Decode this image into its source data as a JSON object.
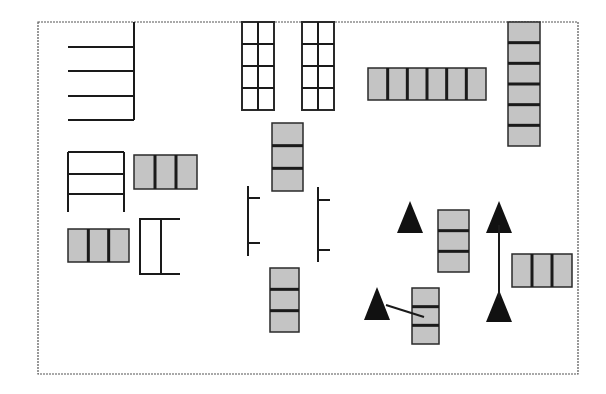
{
  "diagram": {
    "title": "",
    "frame": {
      "x": 38,
      "y": 22,
      "w": 540,
      "h": 352,
      "stroke": "#555555",
      "style": "dashed"
    },
    "colors": {
      "line": "#1a1a1a",
      "seat_fill": "#c4c4c4",
      "seat_stroke": "#2a2a2a",
      "triangle": "#111111"
    },
    "elements": [
      {
        "id": "comb-top-left",
        "type": "comb",
        "spine": {
          "x": 134,
          "y1": 22,
          "y2": 120
        },
        "teeth": [
          47,
          71,
          96,
          120
        ],
        "tooth_x1": 68
      },
      {
        "id": "grid-shelf-1",
        "type": "grid",
        "x": 242,
        "y": 22,
        "w": 32,
        "h": 88,
        "cols": 2,
        "rows": 4
      },
      {
        "id": "grid-shelf-2",
        "type": "grid",
        "x": 302,
        "y": 22,
        "w": 32,
        "h": 88,
        "cols": 2,
        "rows": 4
      },
      {
        "id": "bench-horizontal-6",
        "type": "cells",
        "x": 368,
        "y": 68,
        "w": 118,
        "h": 32,
        "cols": 6,
        "rows": 1
      },
      {
        "id": "stack-right-6",
        "type": "cells",
        "x": 508,
        "y": 22,
        "w": 32,
        "h": 124,
        "cols": 1,
        "rows": 6
      },
      {
        "id": "ladder-left",
        "type": "ladder",
        "x1": 68,
        "x2": 124,
        "y1": 152,
        "y2": 212,
        "rungs": [
          152,
          174,
          194
        ]
      },
      {
        "id": "bench-3-a",
        "type": "cells",
        "x": 134,
        "y": 155,
        "w": 63,
        "h": 34,
        "cols": 3,
        "rows": 1
      },
      {
        "id": "bench-3-b",
        "type": "cells",
        "x": 68,
        "y": 229,
        "w": 61,
        "h": 33,
        "cols": 3,
        "rows": 1
      },
      {
        "id": "bracket-c",
        "type": "bracket",
        "x1": 140,
        "x2": 180,
        "y1": 219,
        "y2": 274,
        "mid_x": 161
      },
      {
        "id": "stack-center-3",
        "type": "cells",
        "x": 272,
        "y": 123,
        "w": 31,
        "h": 68,
        "cols": 1,
        "rows": 3
      },
      {
        "id": "rail-left",
        "type": "rail",
        "x": 248,
        "y1": 186,
        "y2": 256,
        "ticks": [
          198,
          243
        ],
        "dir": 1
      },
      {
        "id": "rail-right",
        "type": "rail",
        "x": 318,
        "y1": 187,
        "y2": 262,
        "ticks": [
          200,
          250
        ],
        "dir": 1
      },
      {
        "id": "stack-bottom-3",
        "type": "cells",
        "x": 270,
        "y": 268,
        "w": 29,
        "h": 64,
        "cols": 1,
        "rows": 3
      },
      {
        "id": "stack-mid-right-3",
        "type": "cells",
        "x": 438,
        "y": 210,
        "w": 31,
        "h": 62,
        "cols": 1,
        "rows": 3
      },
      {
        "id": "stack-low-right-3",
        "type": "cells",
        "x": 412,
        "y": 288,
        "w": 27,
        "h": 56,
        "cols": 1,
        "rows": 3
      },
      {
        "id": "bench-3-right",
        "type": "cells",
        "x": 512,
        "y": 254,
        "w": 60,
        "h": 33,
        "cols": 3,
        "rows": 1
      },
      {
        "id": "triangle-1",
        "type": "triangle",
        "cx": 410,
        "top": 201,
        "base": 233,
        "half": 13
      },
      {
        "id": "triangle-2",
        "type": "triangle",
        "cx": 499,
        "top": 201,
        "base": 233,
        "half": 13
      },
      {
        "id": "triangle-3",
        "type": "triangle",
        "cx": 499,
        "top": 290,
        "base": 322,
        "half": 13
      },
      {
        "id": "triangle-4",
        "type": "triangle",
        "cx": 377,
        "top": 287,
        "base": 320,
        "half": 13
      },
      {
        "id": "link-vertical",
        "type": "line",
        "x1": 499,
        "y1": 225,
        "x2": 499,
        "y2": 298
      },
      {
        "id": "link-diagonal",
        "type": "line",
        "x1": 386,
        "y1": 305,
        "x2": 424,
        "y2": 317
      }
    ]
  }
}
